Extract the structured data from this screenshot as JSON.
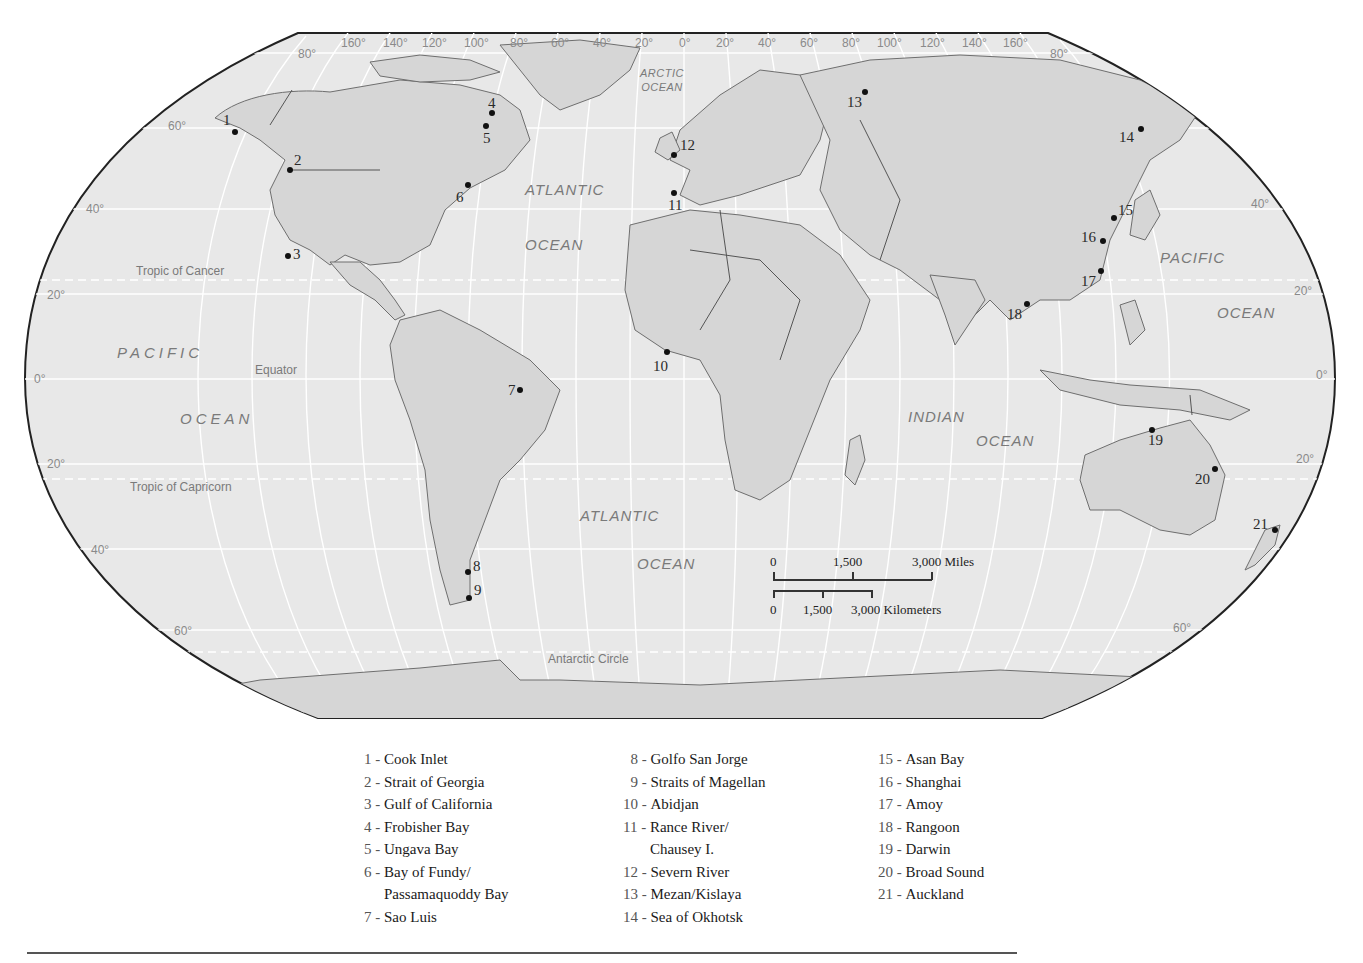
{
  "map": {
    "projection": "Robinson",
    "colors": {
      "ocean": "#e8e8e8",
      "land": "#d6d6d6",
      "outline": "#222222",
      "graticule": "#ffffff",
      "coast": "#6e6e6e"
    },
    "longitude_labels": [
      "160°",
      "140°",
      "120°",
      "100°",
      "80°",
      "60°",
      "40°",
      "20°",
      "0°",
      "20°",
      "40°",
      "60°",
      "80°",
      "100°",
      "120°",
      "140°",
      "160°"
    ],
    "latitude_labels": {
      "left": [
        "80°",
        "60°",
        "40°",
        "20°",
        "0°",
        "20°",
        "40°",
        "60°"
      ],
      "right": [
        "80°",
        "40°",
        "20°",
        "0°",
        "20°",
        "60°"
      ]
    },
    "reference_lines": {
      "tropic_cancer": "Tropic of Cancer",
      "equator": "Equator",
      "tropic_capricorn": "Tropic of Capricorn",
      "antarctic_circle": "Antarctic Circle"
    },
    "oceans": {
      "arctic_1": "ARCTIC",
      "arctic_2": "OCEAN",
      "atlantic_n_1": "ATLANTIC",
      "atlantic_n_2": "OCEAN",
      "atlantic_s_1": "ATLANTIC",
      "atlantic_s_2": "OCEAN",
      "pacific_w_1": "PACIFIC",
      "pacific_w_2": "OCEAN",
      "pacific_e_1": "PACIFIC",
      "pacific_e_2": "OCEAN",
      "indian_1": "INDIAN",
      "indian_2": "OCEAN"
    },
    "markers": [
      {
        "n": "1",
        "x": 235,
        "y": 132
      },
      {
        "n": "2",
        "x": 290,
        "y": 170
      },
      {
        "n": "3",
        "x": 288,
        "y": 256
      },
      {
        "n": "4",
        "x": 492,
        "y": 113
      },
      {
        "n": "5",
        "x": 486,
        "y": 126
      },
      {
        "n": "6",
        "x": 468,
        "y": 185
      },
      {
        "n": "7",
        "x": 520,
        "y": 390
      },
      {
        "n": "8",
        "x": 468,
        "y": 572
      },
      {
        "n": "9",
        "x": 469,
        "y": 598
      },
      {
        "n": "10",
        "x": 667,
        "y": 352
      },
      {
        "n": "11",
        "x": 674,
        "y": 193
      },
      {
        "n": "12",
        "x": 674,
        "y": 155
      },
      {
        "n": "13",
        "x": 865,
        "y": 92
      },
      {
        "n": "14",
        "x": 1141,
        "y": 129
      },
      {
        "n": "15",
        "x": 1114,
        "y": 218
      },
      {
        "n": "16",
        "x": 1103,
        "y": 241
      },
      {
        "n": "17",
        "x": 1101,
        "y": 271
      },
      {
        "n": "18",
        "x": 1027,
        "y": 304
      },
      {
        "n": "19",
        "x": 1152,
        "y": 430
      },
      {
        "n": "20",
        "x": 1215,
        "y": 469
      },
      {
        "n": "21",
        "x": 1275,
        "y": 530
      }
    ],
    "scale": {
      "miles": {
        "t0": "0",
        "t1": "1,500",
        "t2": "3,000 Miles"
      },
      "km": {
        "t0": "0",
        "t1": "1,500",
        "t2": "3,000 Kilometers"
      }
    }
  },
  "legend": {
    "col1": [
      {
        "num": "1 - ",
        "label": "Cook Inlet"
      },
      {
        "num": "2 - ",
        "label": "Strait of Georgia"
      },
      {
        "num": "3 - ",
        "label": "Gulf of California"
      },
      {
        "num": "4 - ",
        "label": "Frobisher Bay"
      },
      {
        "num": "5 - ",
        "label": "Ungava Bay"
      },
      {
        "num": "6 - ",
        "label": "Bay of Fundy/",
        "cont": "Passamaquoddy Bay"
      },
      {
        "num": "7 - ",
        "label": "Sao Luis"
      }
    ],
    "col2": [
      {
        "num": "  8 - ",
        "label": "Golfo San Jorge"
      },
      {
        "num": "  9 - ",
        "label": "Straits of Magellan"
      },
      {
        "num": "10 - ",
        "label": "Abidjan"
      },
      {
        "num": "11 - ",
        "label": "Rance River/",
        "cont": "Chausey I."
      },
      {
        "num": "12 - ",
        "label": "Severn River"
      },
      {
        "num": "13 - ",
        "label": "Mezan/Kislaya"
      },
      {
        "num": "14 - ",
        "label": "Sea of Okhotsk"
      }
    ],
    "col3": [
      {
        "num": "15 - ",
        "label": "Asan Bay"
      },
      {
        "num": "16 - ",
        "label": "Shanghai"
      },
      {
        "num": "17 - ",
        "label": "Amoy"
      },
      {
        "num": "18 - ",
        "label": "Rangoon"
      },
      {
        "num": "19 - ",
        "label": "Darwin"
      },
      {
        "num": "20 - ",
        "label": "Broad Sound"
      },
      {
        "num": "21 - ",
        "label": "Auckland"
      }
    ]
  }
}
